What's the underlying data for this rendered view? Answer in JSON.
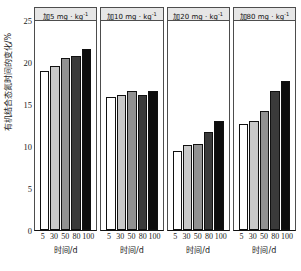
{
  "chart_data": {
    "type": "bar",
    "title": "",
    "ylabel": "有机结合态氮时间的变化/%",
    "xlabel": "时间/d",
    "ylim": [
      0,
      25
    ],
    "yticks": [
      25,
      20,
      15,
      10,
      5,
      0
    ],
    "grid": false,
    "legend": "none",
    "categories": [
      "5",
      "30",
      "50",
      "80",
      "100"
    ],
    "panels": [
      {
        "title_prefix": "加",
        "title_dose": "5",
        "title_unit": "mg · kg",
        "title_exponent": "-1",
        "title": "加5 mg · kg-1",
        "values": [
          18.9,
          19.5,
          20.5,
          20.7,
          21.5
        ]
      },
      {
        "title_prefix": "加",
        "title_dose": "10",
        "title_unit": "mg · kg",
        "title_exponent": "-1",
        "title": "加10 mg · kg-1",
        "values": [
          15.8,
          16.1,
          16.6,
          16.1,
          16.5
        ]
      },
      {
        "title_prefix": "加",
        "title_dose": "20",
        "title_unit": "mg · kg",
        "title_exponent": "-1",
        "title": "加20 mg · kg-1",
        "values": [
          9.4,
          10.1,
          10.2,
          11.7,
          13.0
        ]
      },
      {
        "title_prefix": "加",
        "title_dose": "80",
        "title_unit": "mg · kg",
        "title_exponent": "-1",
        "title": "加80 mg · kg-1",
        "values": [
          12.6,
          13.0,
          14.2,
          16.5,
          17.7
        ]
      }
    ],
    "bar_colors": [
      "#ffffff",
      "#c9c9c9",
      "#919191",
      "#3a3a3a",
      "#0d0d0d"
    ],
    "bar_edge_color": "#111111",
    "panel_title_bg": "#e6e6e6",
    "axis_color": "#4d4d4d",
    "text_color": "#1a1a1a"
  }
}
